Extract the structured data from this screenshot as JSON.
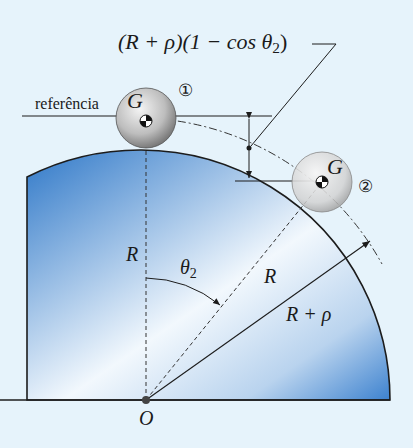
{
  "diagram": {
    "formula_label": "(R + ρ)(1 − cos θ",
    "formula_sub": "2",
    "formula_tail": ")",
    "reference_label": "referência",
    "ball1": {
      "g_label": "G",
      "marker": "①"
    },
    "ball2": {
      "g_label": "G",
      "marker": "②"
    },
    "radius_label_vertical": "R",
    "radius_label_diagonal": "R",
    "radius_plus_rho_label": "R + ρ",
    "angle_label": "θ",
    "angle_sub": "2",
    "origin_label": "O",
    "colors": {
      "background": "#e6f3fb",
      "surface_dark": "#2f78c8",
      "surface_light": "#f2f8fd",
      "outline": "#1c1c1c",
      "ball": "#b9b9b9"
    }
  }
}
